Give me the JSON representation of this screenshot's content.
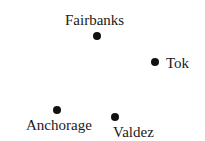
{
  "map": {
    "cities": [
      {
        "name": "Fairbanks",
        "dot": {
          "x": 97,
          "y": 36
        },
        "label": {
          "x": 65,
          "y": 13
        }
      },
      {
        "name": "Tok",
        "dot": {
          "x": 155,
          "y": 62
        },
        "label": {
          "x": 166,
          "y": 56
        }
      },
      {
        "name": "Anchorage",
        "dot": {
          "x": 57,
          "y": 110
        },
        "label": {
          "x": 26,
          "y": 118
        }
      },
      {
        "name": "Valdez",
        "dot": {
          "x": 115,
          "y": 117
        },
        "label": {
          "x": 113,
          "y": 125
        }
      }
    ],
    "colors": {
      "dot": "#111111",
      "text": "#1a1a1a",
      "background": "#ffffff"
    }
  }
}
